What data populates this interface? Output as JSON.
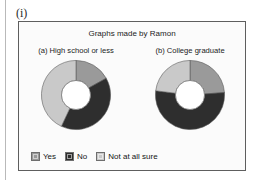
{
  "item_marker": "(i)",
  "figure": {
    "title": "Graphs made by Ramon",
    "panel_a_title": "(a) High school or less",
    "panel_b_title": "(b) College graduate"
  },
  "legend": {
    "items": [
      {
        "label": "Yes",
        "color": "#9a9a9a"
      },
      {
        "label": "No",
        "color": "#2e2e2e"
      },
      {
        "label": "Not at all sure",
        "color": "#c9c9c9"
      }
    ]
  },
  "chart_data": [
    {
      "type": "pie",
      "title": "(a) High school or less",
      "donut": true,
      "hole_ratio": 0.42,
      "start_angle_deg": 0,
      "categories": [
        "Yes",
        "No",
        "Not at all sure"
      ],
      "values": [
        17,
        40,
        43
      ],
      "angles_deg": [
        61,
        144,
        155
      ],
      "colors": [
        "#9a9a9a",
        "#2e2e2e",
        "#c9c9c9"
      ],
      "legend": "bottom"
    },
    {
      "type": "pie",
      "title": "(b) College graduate",
      "donut": true,
      "hole_ratio": 0.42,
      "start_angle_deg": 0,
      "categories": [
        "Yes",
        "No",
        "Not at all sure"
      ],
      "values": [
        24,
        53,
        23
      ],
      "angles_deg": [
        86,
        191,
        83
      ],
      "colors": [
        "#9a9a9a",
        "#2e2e2e",
        "#c9c9c9"
      ],
      "legend": "bottom"
    }
  ]
}
